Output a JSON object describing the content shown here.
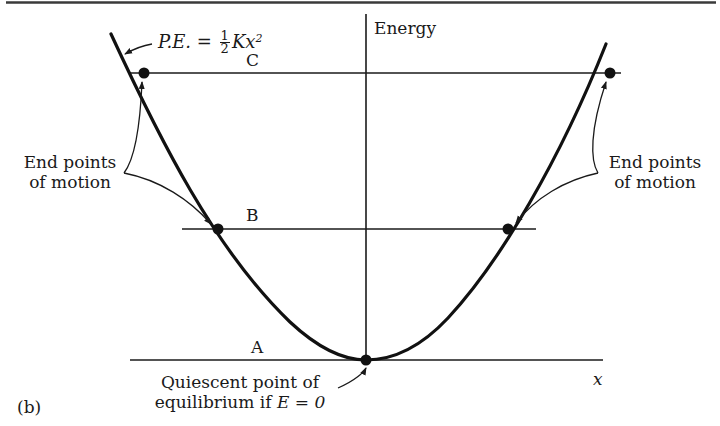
{
  "figure": {
    "panel_label": "(b)",
    "y_axis_label": "Energy",
    "x_axis_label": "x",
    "curve_label": {
      "prefix": "P.E. =",
      "fraction_numerator": "1",
      "fraction_denominator": "2",
      "suffix": "Kx",
      "exponent": "2"
    },
    "levels": [
      {
        "name": "C",
        "label": "C"
      },
      {
        "name": "B",
        "label": "B"
      },
      {
        "name": "A",
        "label": "A"
      }
    ],
    "annotations": {
      "left_end_points": {
        "line1": "End points",
        "line2": "of motion"
      },
      "right_end_points": {
        "line1": "End points",
        "line2": "of motion"
      },
      "equilibrium": {
        "line1": "Quiescent point of",
        "line2_prefix": "equilibrium if",
        "line2_math": "E = 0"
      }
    },
    "colors": {
      "ink": "#1a1a1a",
      "background": "#ffffff"
    }
  }
}
